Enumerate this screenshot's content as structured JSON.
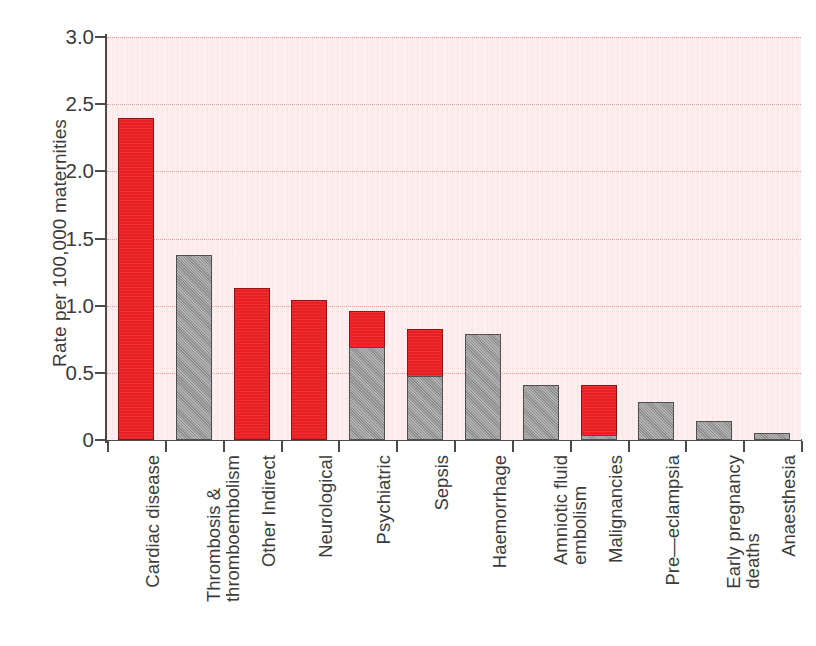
{
  "chart_data": {
    "type": "bar",
    "title": "",
    "xlabel": "",
    "ylabel": "Rate per 100,000 maternities",
    "ylim": [
      0,
      3.0
    ],
    "ytick_labels": [
      "0",
      "0.5",
      "1.0",
      "1.5",
      "2.0",
      "2.5",
      "3.0"
    ],
    "ytick_values": [
      0,
      0.5,
      1.0,
      1.5,
      2.0,
      2.5,
      3.0
    ],
    "grid": "horizontal dotted pink gridlines at every 0.5",
    "legend": "none",
    "stacked": true,
    "colors": {
      "direct_red": "#ED2024",
      "indirect_grey": "#9A9A9A",
      "plot_background": "#FDF1F1",
      "gridline": "#E8989A",
      "axis": "#4A4A4A",
      "text": "#3B3B3B"
    },
    "categories": [
      "Cardiac disease",
      "Thrombosis & thromboembolism",
      "Other Indirect",
      "Neurological",
      "Psychiatric",
      "Sepsis",
      "Haemorrhage",
      "Amniotic fluid embolism",
      "Malignancies",
      "Pre-eclampsia",
      "Early pregnancy deaths",
      "Anaesthesia"
    ],
    "category_label_lines": [
      [
        "Cardiac disease"
      ],
      [
        "Thrombosis &",
        "thromboembolism"
      ],
      [
        "Other Indirect"
      ],
      [
        "Neurological"
      ],
      [
        "Psychiatric"
      ],
      [
        "Sepsis"
      ],
      [
        "Haemorrhage"
      ],
      [
        "Amniotic fluid",
        "embolism"
      ],
      [
        "Malignancies"
      ],
      [
        "Pre—eclampsia"
      ],
      [
        "Early pregnancy",
        "deaths"
      ],
      [
        "Anaesthesia"
      ]
    ],
    "series": [
      {
        "name": "grey",
        "values": [
          0,
          1.38,
          0,
          0,
          0.69,
          0.48,
          0.79,
          0.41,
          0.04,
          0.28,
          0.14,
          0.05
        ]
      },
      {
        "name": "red",
        "values": [
          2.4,
          0,
          1.13,
          1.04,
          0.27,
          0.35,
          0,
          0,
          0.37,
          0,
          0,
          0
        ]
      }
    ],
    "totals": [
      2.4,
      1.38,
      1.13,
      1.04,
      0.96,
      0.83,
      0.79,
      0.41,
      0.41,
      0.28,
      0.14,
      0.05
    ]
  },
  "bars": [
    {
      "label": "Cardiac disease",
      "total": 2.4,
      "segments": [
        {
          "color": "red",
          "value": 2.4
        }
      ]
    },
    {
      "label": "Thrombosis & thromboembolism",
      "total": 1.38,
      "segments": [
        {
          "color": "grey",
          "value": 1.38
        }
      ]
    },
    {
      "label": "Other Indirect",
      "total": 1.13,
      "segments": [
        {
          "color": "red",
          "value": 1.13
        }
      ]
    },
    {
      "label": "Neurological",
      "total": 1.04,
      "segments": [
        {
          "color": "red",
          "value": 1.04
        }
      ]
    },
    {
      "label": "Psychiatric",
      "total": 0.96,
      "segments": [
        {
          "color": "red",
          "value": 0.27
        },
        {
          "color": "grey",
          "value": 0.69
        }
      ]
    },
    {
      "label": "Sepsis",
      "total": 0.83,
      "segments": [
        {
          "color": "red",
          "value": 0.35
        },
        {
          "color": "grey",
          "value": 0.48
        }
      ]
    },
    {
      "label": "Haemorrhage",
      "total": 0.79,
      "segments": [
        {
          "color": "grey",
          "value": 0.79
        }
      ]
    },
    {
      "label": "Amniotic fluid embolism",
      "total": 0.41,
      "segments": [
        {
          "color": "grey",
          "value": 0.41
        }
      ]
    },
    {
      "label": "Malignancies",
      "total": 0.41,
      "segments": [
        {
          "color": "red",
          "value": 0.37
        },
        {
          "color": "grey",
          "value": 0.04
        }
      ]
    },
    {
      "label": "Pre—eclampsia",
      "total": 0.28,
      "segments": [
        {
          "color": "grey",
          "value": 0.28
        }
      ]
    },
    {
      "label": "Early pregnancy deaths",
      "total": 0.14,
      "segments": [
        {
          "color": "grey",
          "value": 0.14
        }
      ]
    },
    {
      "label": "Anaesthesia",
      "total": 0.05,
      "segments": [
        {
          "color": "grey",
          "value": 0.05
        }
      ]
    }
  ]
}
